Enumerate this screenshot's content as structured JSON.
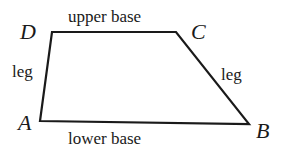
{
  "diagram": {
    "type": "trapezoid",
    "stroke_color": "#1a1a1a",
    "vertices": {
      "A": {
        "label": "A",
        "x": 40,
        "y": 121
      },
      "B": {
        "label": "B",
        "x": 249,
        "y": 124
      },
      "C": {
        "label": "C",
        "x": 176,
        "y": 32
      },
      "D": {
        "label": "D",
        "x": 52,
        "y": 32
      }
    },
    "edges": {
      "upper_base": {
        "label": "upper base",
        "from": "D",
        "to": "C"
      },
      "lower_base": {
        "label": "lower base",
        "from": "A",
        "to": "B"
      },
      "left_leg": {
        "label": "leg",
        "from": "A",
        "to": "D"
      },
      "right_leg": {
        "label": "leg",
        "from": "C",
        "to": "B"
      }
    }
  }
}
